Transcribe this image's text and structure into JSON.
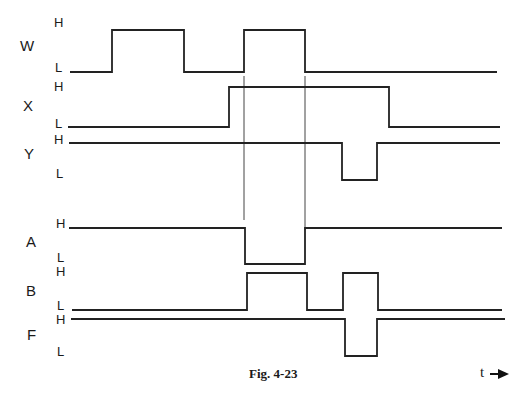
{
  "figure": {
    "caption": "Fig. 4-23",
    "time_axis_label": "t",
    "time_axis_icon": "right-arrow-icon",
    "level_high_label": "H",
    "level_low_label": "L"
  },
  "signals": [
    {
      "name": "W",
      "high_y": 30,
      "low_y": 72,
      "x_start": 70,
      "x_end": 497,
      "segments": [
        [
          "L",
          70,
          112
        ],
        [
          "H",
          112,
          184
        ],
        [
          "L",
          184,
          244
        ],
        [
          "H",
          244,
          305
        ],
        [
          "L",
          305,
          497
        ]
      ]
    },
    {
      "name": "X",
      "high_y": 87,
      "low_y": 127,
      "x_start": 68,
      "x_end": 500,
      "segments": [
        [
          "L",
          68,
          229
        ],
        [
          "H",
          229,
          389
        ],
        [
          "L",
          389,
          500
        ]
      ]
    },
    {
      "name": "Y",
      "high_y": 143,
      "low_y": 180,
      "x_start": 69,
      "x_end": 500,
      "segments": [
        [
          "H",
          69,
          342
        ],
        [
          "L",
          342,
          377
        ],
        [
          "H",
          377,
          500
        ]
      ]
    },
    {
      "name": "A",
      "high_y": 228,
      "low_y": 264,
      "x_start": 69,
      "x_end": 502,
      "segments": [
        [
          "H",
          69,
          245
        ],
        [
          "L",
          245,
          305
        ],
        [
          "H",
          305,
          502
        ]
      ]
    },
    {
      "name": "B",
      "high_y": 273,
      "low_y": 310,
      "x_start": 72,
      "x_end": 502,
      "segments": [
        [
          "L",
          72,
          247
        ],
        [
          "H",
          247,
          307
        ],
        [
          "L",
          307,
          343
        ],
        [
          "H",
          343,
          378
        ],
        [
          "L",
          378,
          502
        ]
      ]
    },
    {
      "name": "F",
      "high_y": 319,
      "low_y": 356,
      "x_start": 71,
      "x_end": 505,
      "segments": [
        [
          "H",
          71,
          345
        ],
        [
          "L",
          345,
          377
        ],
        [
          "H",
          377,
          505
        ]
      ]
    }
  ],
  "guide_lines": [
    {
      "x": 244,
      "y1": 76,
      "y2": 220
    },
    {
      "x": 305,
      "y1": 76,
      "y2": 230
    }
  ],
  "labels": {
    "W": {
      "name": "W",
      "H": "H",
      "L": "L"
    },
    "X": {
      "name": "X",
      "H": "H",
      "L": "L"
    },
    "Y": {
      "name": "Y",
      "H": "H",
      "L": "L"
    },
    "A": {
      "name": "A",
      "H": "H",
      "L": "L"
    },
    "B": {
      "name": "B",
      "H": "H",
      "L": "L"
    },
    "F": {
      "name": "F",
      "H": "H",
      "L": "L"
    }
  }
}
